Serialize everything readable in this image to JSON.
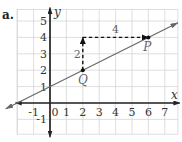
{
  "problem": {
    "part_label": "a."
  },
  "chart_data": {
    "type": "line",
    "title": "",
    "xlabel": "x",
    "ylabel": "y",
    "xlim": [
      -2,
      7.8
    ],
    "ylim": [
      -1.9,
      5.7
    ],
    "grid": true,
    "x_ticks": [
      "-1",
      "0",
      "1",
      "2",
      "3",
      "4",
      "5",
      "6",
      "7"
    ],
    "y_ticks": [
      "-1",
      "1",
      "2",
      "3",
      "4",
      "5"
    ],
    "series": [
      {
        "name": "line",
        "x": [
          -2.7,
          7.8
        ],
        "y": [
          -0.35,
          4.9
        ],
        "slope": 0.5,
        "intercept": 1
      }
    ],
    "points": [
      {
        "label": "Q",
        "x": 2,
        "y": 2
      },
      {
        "label": "P",
        "x": 6,
        "y": 4
      }
    ],
    "annotations": [
      {
        "type": "dashed-arrow",
        "from": [
          2,
          2
        ],
        "to": [
          2,
          4
        ],
        "label": "2"
      },
      {
        "type": "dashed-arrow",
        "from": [
          2,
          4
        ],
        "to": [
          6,
          4
        ],
        "label": "4"
      }
    ]
  },
  "colors": {
    "grid": "#d6d6d6",
    "axis": "#222222",
    "line": "#666666",
    "text": "#333333",
    "label_gray": "#666666"
  }
}
